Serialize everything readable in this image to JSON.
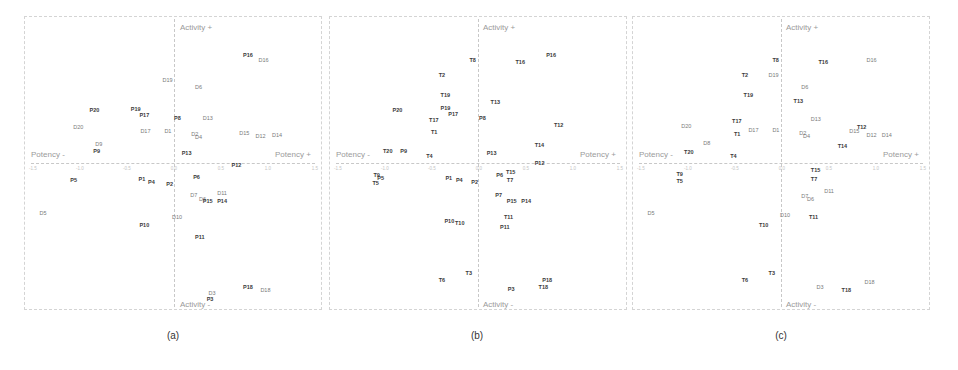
{
  "chart_data": [
    {
      "type": "scatter",
      "panel": "(a)",
      "xlabel_neg": "Potency -",
      "xlabel_pos": "Potency +",
      "ylabel_pos": "Activity +",
      "ylabel_neg": "Activity -",
      "xlim": [
        -1.5,
        1.5
      ],
      "ylim": [
        -1.5,
        1.5
      ],
      "x_ticks": [
        "-1.5",
        "-1.0",
        "-0.5",
        "0.0",
        "0.5",
        "1.0",
        "1.5"
      ],
      "points": [
        {
          "label": "P16",
          "x": 0.72,
          "y": 1.1,
          "style": "bold"
        },
        {
          "label": "D16",
          "x": 0.88,
          "y": 1.05,
          "style": "light"
        },
        {
          "label": "D19",
          "x": -0.12,
          "y": 0.85,
          "style": "light"
        },
        {
          "label": "D6",
          "x": 0.22,
          "y": 0.78,
          "style": "light"
        },
        {
          "label": "P20",
          "x": -0.88,
          "y": 0.55,
          "style": "bold"
        },
        {
          "label": "P19",
          "x": -0.45,
          "y": 0.56,
          "style": "bold"
        },
        {
          "label": "P17",
          "x": -0.36,
          "y": 0.5,
          "style": "bold"
        },
        {
          "label": "P8",
          "x": 0.0,
          "y": 0.47,
          "style": "bold"
        },
        {
          "label": "D13",
          "x": 0.3,
          "y": 0.47,
          "style": "light"
        },
        {
          "label": "D20",
          "x": -1.05,
          "y": 0.38,
          "style": "light"
        },
        {
          "label": "D17",
          "x": -0.35,
          "y": 0.34,
          "style": "light"
        },
        {
          "label": "D1",
          "x": -0.1,
          "y": 0.34,
          "style": "light"
        },
        {
          "label": "D2",
          "x": 0.18,
          "y": 0.31,
          "style": "light"
        },
        {
          "label": "D4",
          "x": 0.22,
          "y": 0.28,
          "style": "light"
        },
        {
          "label": "D15",
          "x": 0.68,
          "y": 0.32,
          "style": "light"
        },
        {
          "label": "D12",
          "x": 0.85,
          "y": 0.29,
          "style": "light"
        },
        {
          "label": "D14",
          "x": 1.02,
          "y": 0.3,
          "style": "light"
        },
        {
          "label": "D9",
          "x": -0.82,
          "y": 0.21,
          "style": "light"
        },
        {
          "label": "P9",
          "x": -0.84,
          "y": 0.14,
          "style": "bold"
        },
        {
          "label": "P13",
          "x": 0.08,
          "y": 0.12,
          "style": "bold"
        },
        {
          "label": "P12",
          "x": 0.6,
          "y": 0.0,
          "style": "bold"
        },
        {
          "label": "P5",
          "x": -1.08,
          "y": -0.15,
          "style": "bold"
        },
        {
          "label": "P6",
          "x": 0.2,
          "y": -0.12,
          "style": "bold"
        },
        {
          "label": "P1",
          "x": -0.37,
          "y": -0.14,
          "style": "bold"
        },
        {
          "label": "P4",
          "x": -0.27,
          "y": -0.17,
          "style": "bold"
        },
        {
          "label": "P2",
          "x": -0.08,
          "y": -0.19,
          "style": "bold"
        },
        {
          "label": "D11",
          "x": 0.45,
          "y": -0.28,
          "style": "light"
        },
        {
          "label": "D7",
          "x": 0.17,
          "y": -0.3,
          "style": "light"
        },
        {
          "label": "D6",
          "x": 0.26,
          "y": -0.34,
          "style": "light"
        },
        {
          "label": "P15",
          "x": 0.3,
          "y": -0.36,
          "style": "bold"
        },
        {
          "label": "P14",
          "x": 0.45,
          "y": -0.36,
          "style": "bold"
        },
        {
          "label": "D5",
          "x": -1.4,
          "y": -0.48,
          "style": "light"
        },
        {
          "label": "D10",
          "x": -0.02,
          "y": -0.52,
          "style": "light"
        },
        {
          "label": "P10",
          "x": -0.36,
          "y": -0.6,
          "style": "bold"
        },
        {
          "label": "P11",
          "x": 0.22,
          "y": -0.72,
          "style": "bold"
        },
        {
          "label": "P18",
          "x": 0.72,
          "y": -1.22,
          "style": "bold"
        },
        {
          "label": "D18",
          "x": 0.9,
          "y": -1.25,
          "style": "light"
        },
        {
          "label": "D3",
          "x": 0.36,
          "y": -1.28,
          "style": "light"
        },
        {
          "label": "P3",
          "x": 0.34,
          "y": -1.34,
          "style": "bold"
        }
      ]
    },
    {
      "type": "scatter",
      "panel": "(b)",
      "xlabel_neg": "Potency -",
      "xlabel_pos": "Potency +",
      "ylabel_pos": "Activity +",
      "ylabel_neg": "Activity -",
      "xlim": [
        -1.5,
        1.5
      ],
      "ylim": [
        -1.5,
        1.5
      ],
      "x_ticks": [
        "-1.5",
        "-1.0",
        "-0.5",
        "0.0",
        "0.5",
        "1.0",
        "1.5"
      ],
      "points": [
        {
          "label": "T8",
          "x": -0.1,
          "y": 1.05,
          "style": "bold"
        },
        {
          "label": "T16",
          "x": 0.38,
          "y": 1.03,
          "style": "bold"
        },
        {
          "label": "P16",
          "x": 0.7,
          "y": 1.1,
          "style": "bold"
        },
        {
          "label": "T2",
          "x": -0.42,
          "y": 0.9,
          "style": "bold"
        },
        {
          "label": "T19",
          "x": -0.4,
          "y": 0.7,
          "style": "bold"
        },
        {
          "label": "P20",
          "x": -0.9,
          "y": 0.55,
          "style": "bold"
        },
        {
          "label": "P19",
          "x": -0.4,
          "y": 0.57,
          "style": "bold"
        },
        {
          "label": "P17",
          "x": -0.32,
          "y": 0.51,
          "style": "bold"
        },
        {
          "label": "T13",
          "x": 0.12,
          "y": 0.63,
          "style": "bold"
        },
        {
          "label": "P8",
          "x": 0.0,
          "y": 0.47,
          "style": "bold"
        },
        {
          "label": "T17",
          "x": -0.52,
          "y": 0.45,
          "style": "bold"
        },
        {
          "label": "T12",
          "x": 0.78,
          "y": 0.4,
          "style": "bold"
        },
        {
          "label": "T1",
          "x": -0.5,
          "y": 0.33,
          "style": "bold"
        },
        {
          "label": "T14",
          "x": 0.58,
          "y": 0.2,
          "style": "bold"
        },
        {
          "label": "T20",
          "x": -1.0,
          "y": 0.14,
          "style": "bold"
        },
        {
          "label": "P9",
          "x": -0.82,
          "y": 0.14,
          "style": "bold"
        },
        {
          "label": "P13",
          "x": 0.08,
          "y": 0.12,
          "style": "bold"
        },
        {
          "label": "T4",
          "x": -0.55,
          "y": 0.09,
          "style": "bold"
        },
        {
          "label": "P12",
          "x": 0.58,
          "y": 0.02,
          "style": "bold"
        },
        {
          "label": "T15",
          "x": 0.28,
          "y": -0.07,
          "style": "bold"
        },
        {
          "label": "T9",
          "x": -1.1,
          "y": -0.1,
          "style": "bold"
        },
        {
          "label": "P5",
          "x": -1.06,
          "y": -0.13,
          "style": "bold"
        },
        {
          "label": "T5",
          "x": -1.11,
          "y": -0.18,
          "style": "bold"
        },
        {
          "label": "P6",
          "x": 0.18,
          "y": -0.1,
          "style": "bold"
        },
        {
          "label": "T7",
          "x": 0.29,
          "y": -0.15,
          "style": "bold"
        },
        {
          "label": "P1",
          "x": -0.35,
          "y": -0.13,
          "style": "bold"
        },
        {
          "label": "P4",
          "x": -0.24,
          "y": -0.15,
          "style": "bold"
        },
        {
          "label": "P2",
          "x": -0.08,
          "y": -0.17,
          "style": "bold"
        },
        {
          "label": "P7",
          "x": 0.17,
          "y": -0.3,
          "style": "bold"
        },
        {
          "label": "P15",
          "x": 0.29,
          "y": -0.36,
          "style": "bold"
        },
        {
          "label": "P14",
          "x": 0.44,
          "y": -0.36,
          "style": "bold"
        },
        {
          "label": "T11",
          "x": 0.26,
          "y": -0.52,
          "style": "bold"
        },
        {
          "label": "P10",
          "x": -0.36,
          "y": -0.56,
          "style": "bold"
        },
        {
          "label": "T10",
          "x": -0.25,
          "y": -0.58,
          "style": "bold"
        },
        {
          "label": "P11",
          "x": 0.22,
          "y": -0.62,
          "style": "bold"
        },
        {
          "label": "T3",
          "x": -0.14,
          "y": -1.08,
          "style": "bold"
        },
        {
          "label": "T6",
          "x": -0.42,
          "y": -1.15,
          "style": "bold"
        },
        {
          "label": "P18",
          "x": 0.66,
          "y": -1.15,
          "style": "bold"
        },
        {
          "label": "P3",
          "x": 0.3,
          "y": -1.24,
          "style": "bold"
        },
        {
          "label": "T18",
          "x": 0.62,
          "y": -1.22,
          "style": "bold"
        }
      ]
    },
    {
      "type": "scatter",
      "panel": "(c)",
      "xlabel_neg": "Potency -",
      "xlabel_pos": "Potency +",
      "ylabel_pos": "Activity +",
      "ylabel_neg": "Activity -",
      "xlim": [
        -1.5,
        1.5
      ],
      "ylim": [
        -1.5,
        1.5
      ],
      "x_ticks": [
        "-1.5",
        "-1.0",
        "-0.5",
        "0.0",
        "0.5",
        "1.0",
        "1.5"
      ],
      "points": [
        {
          "label": "T8",
          "x": -0.1,
          "y": 1.05,
          "style": "bold"
        },
        {
          "label": "T16",
          "x": 0.38,
          "y": 1.03,
          "style": "bold"
        },
        {
          "label": "D16",
          "x": 0.88,
          "y": 1.05,
          "style": "light"
        },
        {
          "label": "T2",
          "x": -0.42,
          "y": 0.9,
          "style": "bold"
        },
        {
          "label": "D19",
          "x": -0.14,
          "y": 0.9,
          "style": "light"
        },
        {
          "label": "D6",
          "x": 0.2,
          "y": 0.78,
          "style": "light"
        },
        {
          "label": "T19",
          "x": -0.4,
          "y": 0.7,
          "style": "bold"
        },
        {
          "label": "T13",
          "x": 0.12,
          "y": 0.64,
          "style": "bold"
        },
        {
          "label": "D13",
          "x": 0.3,
          "y": 0.46,
          "style": "light"
        },
        {
          "label": "T17",
          "x": -0.52,
          "y": 0.44,
          "style": "bold"
        },
        {
          "label": "D20",
          "x": -1.05,
          "y": 0.39,
          "style": "light"
        },
        {
          "label": "D17",
          "x": -0.35,
          "y": 0.35,
          "style": "light"
        },
        {
          "label": "D1",
          "x": -0.1,
          "y": 0.35,
          "style": "light"
        },
        {
          "label": "T12",
          "x": 0.78,
          "y": 0.38,
          "style": "bold"
        },
        {
          "label": "D15",
          "x": 0.7,
          "y": 0.34,
          "style": "light"
        },
        {
          "label": "D2",
          "x": 0.18,
          "y": 0.32,
          "style": "light"
        },
        {
          "label": "D4",
          "x": 0.22,
          "y": 0.29,
          "style": "light"
        },
        {
          "label": "D12",
          "x": 0.88,
          "y": 0.3,
          "style": "light"
        },
        {
          "label": "D14",
          "x": 1.04,
          "y": 0.3,
          "style": "light"
        },
        {
          "label": "T1",
          "x": -0.5,
          "y": 0.31,
          "style": "bold"
        },
        {
          "label": "D8",
          "x": -0.82,
          "y": 0.22,
          "style": "light"
        },
        {
          "label": "T14",
          "x": 0.58,
          "y": 0.19,
          "style": "bold"
        },
        {
          "label": "T20",
          "x": -1.02,
          "y": 0.13,
          "style": "bold"
        },
        {
          "label": "T4",
          "x": -0.54,
          "y": 0.09,
          "style": "bold"
        },
        {
          "label": "T15",
          "x": 0.3,
          "y": -0.05,
          "style": "bold"
        },
        {
          "label": "T9",
          "x": -1.1,
          "y": -0.09,
          "style": "bold"
        },
        {
          "label": "T5",
          "x": -1.1,
          "y": -0.16,
          "style": "bold"
        },
        {
          "label": "T7",
          "x": 0.3,
          "y": -0.14,
          "style": "bold"
        },
        {
          "label": "D11",
          "x": 0.44,
          "y": -0.26,
          "style": "light"
        },
        {
          "label": "D7",
          "x": 0.2,
          "y": -0.31,
          "style": "light"
        },
        {
          "label": "D6",
          "x": 0.26,
          "y": -0.34,
          "style": "light"
        },
        {
          "label": "D5",
          "x": -1.4,
          "y": -0.48,
          "style": "light"
        },
        {
          "label": "D10",
          "x": -0.02,
          "y": -0.5,
          "style": "light"
        },
        {
          "label": "T11",
          "x": 0.28,
          "y": -0.52,
          "style": "bold"
        },
        {
          "label": "T10",
          "x": -0.24,
          "y": -0.6,
          "style": "bold"
        },
        {
          "label": "T3",
          "x": -0.14,
          "y": -1.08,
          "style": "bold"
        },
        {
          "label": "T6",
          "x": -0.42,
          "y": -1.15,
          "style": "bold"
        },
        {
          "label": "D3",
          "x": 0.36,
          "y": -1.22,
          "style": "light"
        },
        {
          "label": "T18",
          "x": 0.62,
          "y": -1.25,
          "style": "bold"
        },
        {
          "label": "D18",
          "x": 0.86,
          "y": -1.17,
          "style": "light"
        }
      ]
    }
  ],
  "captions": [
    "(a)",
    "(b)",
    "(c)"
  ]
}
